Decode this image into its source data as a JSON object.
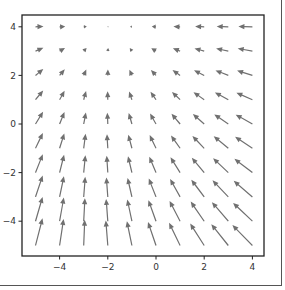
{
  "chart_data": {
    "type": "quiver",
    "title": "",
    "xlabel": "",
    "ylabel": "",
    "xlim": [
      -5.6,
      4.5
    ],
    "ylim": [
      -5.4,
      4.4
    ],
    "xticks": [
      -4,
      -2,
      0,
      2,
      4
    ],
    "yticks": [
      4,
      2,
      0,
      -2,
      -4
    ],
    "xtick_labels": [
      "−4",
      "−2",
      "0",
      "2",
      "4"
    ],
    "ytick_labels": [
      "4",
      "2",
      "0",
      "−2",
      "−4"
    ],
    "grid": false,
    "arrow_color": "#707070",
    "x": [
      -5,
      -4,
      -3,
      -2,
      -1,
      0,
      1,
      2,
      3,
      4
    ],
    "y": [
      4,
      3,
      2,
      1,
      0,
      -1,
      -2,
      -3,
      -4,
      -5
    ],
    "u": [
      [
        8.0,
        5.6,
        3.1,
        0.7,
        -1.8,
        -4.2,
        -6.7,
        -9.1,
        -11.6,
        -14.0
      ],
      [
        7.9,
        5.4,
        2.9,
        0.4,
        -2.1,
        -4.7,
        -7.2,
        -9.7,
        -12.2,
        -14.7
      ],
      [
        7.8,
        5.2,
        2.6,
        0.1,
        -2.5,
        -5.1,
        -7.6,
        -10.2,
        -12.8,
        -15.3
      ],
      [
        7.7,
        5.0,
        2.4,
        -0.2,
        -2.8,
        -5.5,
        -8.1,
        -10.7,
        -13.4,
        -16.0
      ],
      [
        7.6,
        4.9,
        2.2,
        -0.5,
        -3.2,
        -5.9,
        -8.6,
        -11.3,
        -14.0,
        -16.7
      ],
      [
        7.4,
        4.7,
        1.9,
        -0.8,
        -3.6,
        -6.3,
        -9.1,
        -11.8,
        -14.6,
        -17.3
      ],
      [
        7.3,
        4.5,
        1.7,
        -1.1,
        -3.9,
        -6.7,
        -9.6,
        -12.4,
        -15.2,
        -18.0
      ],
      [
        7.2,
        4.3,
        1.5,
        -1.4,
        -4.3,
        -7.2,
        -10.0,
        -12.9,
        -15.8,
        -18.7
      ],
      [
        7.1,
        4.2,
        1.2,
        -1.7,
        -4.6,
        -7.6,
        -10.5,
        -13.5,
        -16.4,
        -19.3
      ],
      [
        7.0,
        4.0,
        1.0,
        -2.0,
        -5.0,
        -8.0,
        -11.0,
        -14.0,
        -17.0,
        -20.0
      ]
    ],
    "v": [
      [
        0.3,
        0.3,
        0.3,
        0.3,
        0.3,
        0.3,
        0.3,
        0.3,
        0.3,
        0.3
      ],
      [
        3.3,
        3.2,
        3.1,
        3.0,
        3.0,
        2.9,
        2.8,
        2.7,
        2.6,
        2.6
      ],
      [
        6.3,
        6.1,
        6.0,
        5.8,
        5.6,
        5.5,
        5.3,
        5.1,
        5.0,
        4.8
      ],
      [
        9.3,
        9.0,
        8.8,
        8.5,
        8.3,
        8.0,
        7.8,
        7.5,
        7.3,
        7.0
      ],
      [
        12.3,
        12.0,
        11.6,
        11.3,
        11.0,
        10.6,
        10.3,
        10.0,
        9.6,
        9.3
      ],
      [
        15.3,
        14.9,
        14.5,
        14.1,
        13.6,
        13.2,
        12.8,
        12.4,
        12.0,
        11.6
      ],
      [
        18.3,
        17.8,
        17.3,
        16.8,
        16.3,
        15.8,
        15.3,
        14.8,
        14.3,
        13.8
      ],
      [
        21.3,
        20.7,
        20.1,
        19.5,
        19.0,
        18.4,
        17.8,
        17.2,
        16.6,
        16.1
      ],
      [
        24.3,
        23.6,
        23.0,
        22.3,
        21.6,
        21.0,
        20.3,
        19.6,
        19.0,
        18.3
      ],
      [
        27.3,
        26.5,
        25.8,
        25.0,
        24.3,
        23.5,
        22.8,
        22.0,
        21.3,
        20.5
      ]
    ],
    "units_note": "u, v approximate arrow components in screen pixels (v positive = up)"
  }
}
